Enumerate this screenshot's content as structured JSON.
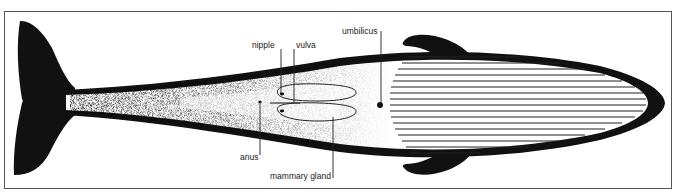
{
  "diagram": {
    "colors": {
      "ink": "#111111",
      "paper": "#ffffff",
      "frame": "#555555"
    },
    "labels": {
      "nipple": "nipple",
      "vulva": "vulva",
      "umbilicus": "umbilicus",
      "anus": "anus",
      "mammary_gland": "mammary gland"
    },
    "throat_grooves_count": 17
  }
}
